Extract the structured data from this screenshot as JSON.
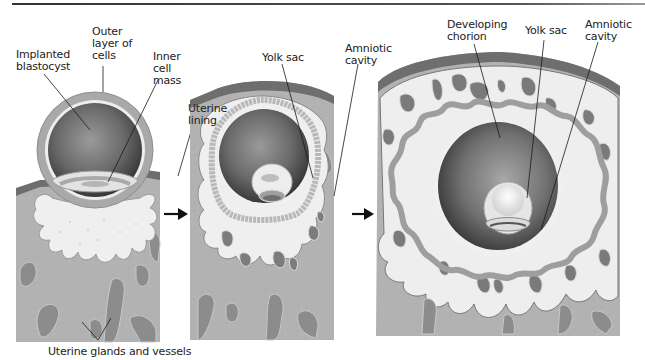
{
  "figure": {
    "colors": {
      "tissue": "#b4b4b4",
      "tissue_dark": "#8e8e8e",
      "uterine_surface": "#6e6e6e",
      "glands": "#8a8a8a",
      "decidua_light": "#eeeeee",
      "cavity_dark": "#4a4a4a",
      "shell": "#a6a6a6",
      "line": "#1a1a1a"
    },
    "arrows": [
      {
        "from": "stage-1",
        "to": "stage-2",
        "icon": "right-arrow-icon"
      },
      {
        "from": "stage-2",
        "to": "stage-3",
        "icon": "right-arrow-icon"
      }
    ]
  },
  "panels": [
    {
      "id": "stage-1",
      "labels": {
        "implanted_blastocyst": "Implanted\nblastocyst",
        "outer_layer": "Outer\nlayer of\ncells",
        "inner_cell_mass": "Inner\ncell\nmass",
        "uterine_lining": "Uterine\nlining",
        "glands": "Uterine glands and vessels"
      }
    },
    {
      "id": "stage-2",
      "labels": {
        "yolk_sac": "Yolk sac",
        "amniotic_cavity": "Amniotic\ncavity"
      }
    },
    {
      "id": "stage-3",
      "labels": {
        "developing_chorion": "Developing\nchorion",
        "yolk_sac": "Yolk sac",
        "amniotic_cavity": "Amniotic\ncavity"
      }
    }
  ]
}
